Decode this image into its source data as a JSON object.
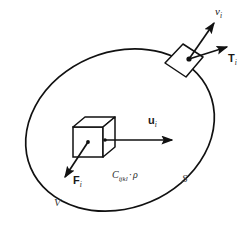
{
  "figure": {
    "background_color": "#ffffff",
    "stroke_color": "#111111",
    "labels": {
      "velocity": {
        "symbol": "v",
        "subscript": "i"
      },
      "traction": {
        "symbol": "T",
        "subscript": "i"
      },
      "displacement": {
        "symbol": "u",
        "subscript": "i"
      },
      "body_force": {
        "symbol": "F",
        "subscript": "i"
      },
      "surface": "S",
      "volume": "V",
      "material": {
        "symbol": "C",
        "subscript": "ijkl",
        "separator": "·",
        "density": "ρ"
      }
    },
    "elements": {
      "boundary_name": "ellipse-boundary",
      "surface_patch_name": "surface-element-patch",
      "cube_name": "volume-element-cube"
    }
  }
}
